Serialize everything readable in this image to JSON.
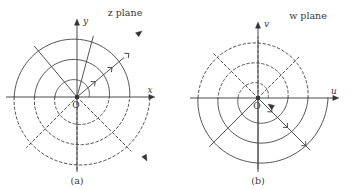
{
  "figure": {
    "background": "#ffffff",
    "ink": "#4a4a4a",
    "ink_dark": "#333333",
    "panels": [
      {
        "id": "a",
        "caption": "(a)",
        "plane_label": "z plane",
        "origin_label": "O",
        "axis_horizontal_label": "x",
        "axis_vertical_label": "y",
        "origin": {
          "x": 77,
          "y": 97
        },
        "axis_x_start": 6,
        "axis_x_end": 152,
        "axis_y_top": 22,
        "axis_y_bottom": 172,
        "solid_half": "upper",
        "dashed_half": "lower",
        "spiral": {
          "kind": "archimedean",
          "turns": 3,
          "radii_at_positive_x_axis": [
            12,
            31,
            52,
            73
          ],
          "ray_angles_deg": [
            0,
            40,
            75,
            130,
            180,
            225,
            270,
            315
          ],
          "direction": "outward"
        },
        "arrowheads": [
          {
            "name": "spiral-arrow-upper-right",
            "x": 142,
            "y": 31,
            "angle_deg": -38
          },
          {
            "name": "spiral-arrow-lower-right",
            "x": 147,
            "y": 161,
            "angle_deg": 62
          }
        ]
      },
      {
        "id": "b",
        "caption": "(b)",
        "plane_label": "w plane",
        "origin_label": "O",
        "axis_horizontal_label": "u",
        "axis_vertical_label": "v",
        "origin": {
          "x": 258,
          "y": 98
        },
        "axis_x_start": 190,
        "axis_x_end": 336,
        "axis_y_top": 25,
        "axis_y_bottom": 172,
        "solid_half": "lower",
        "dashed_half": "upper",
        "spiral": {
          "kind": "archimedean",
          "turns": 3,
          "radii_at_positive_x_axis": [
            10,
            28,
            48,
            70
          ],
          "ray_angles_deg": [
            0,
            45,
            90,
            135,
            180,
            225,
            270,
            315
          ],
          "direction": "inward"
        },
        "arrowheads": [
          {
            "name": "spiral-arrow-origin",
            "x": 268,
            "y": 104,
            "angle_deg": 215
          }
        ]
      }
    ]
  }
}
